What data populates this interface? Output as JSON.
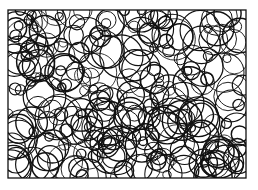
{
  "figure": {
    "frame": {
      "x": 8,
      "y": 10,
      "width": 238,
      "height": 168
    },
    "stroke_color": "#111111",
    "background": "#ffffff",
    "circle_count": 260,
    "radius_range": [
      4,
      22
    ],
    "seed": 7
  }
}
